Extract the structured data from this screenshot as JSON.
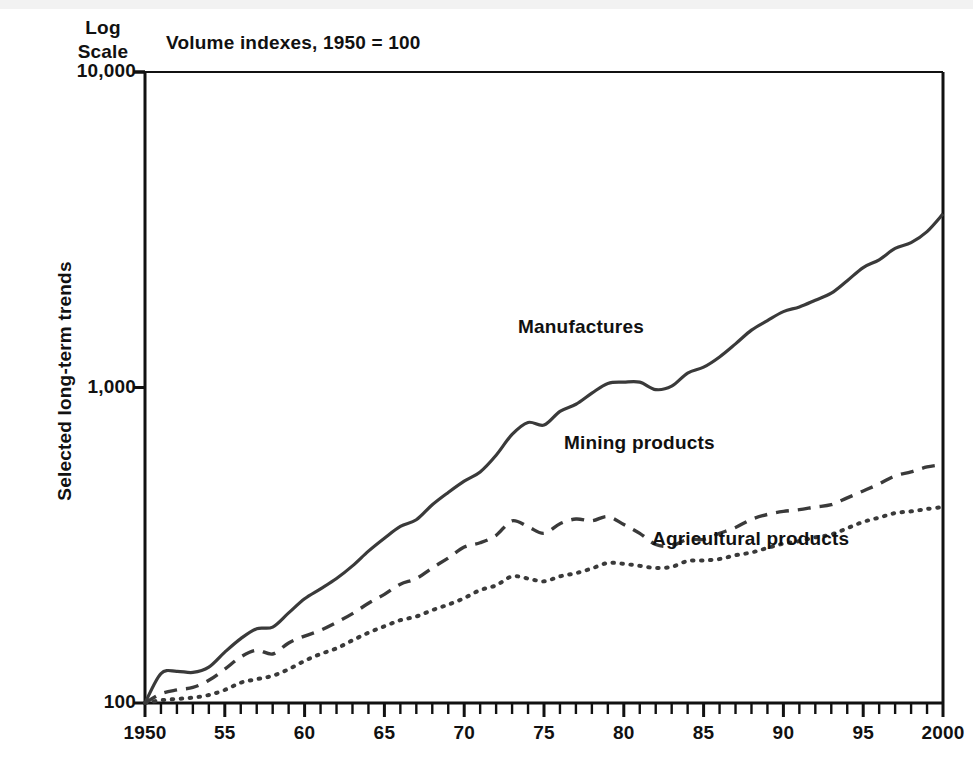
{
  "header": {
    "log_scale_line1": "Log",
    "log_scale_line2": "Scale",
    "title": "Volume indexes, 1950 = 100",
    "y_axis_title": "Selected long-term trends"
  },
  "labels": {
    "manufactures": "Manufactures",
    "mining": "Mining products",
    "agricultural": "Agricultural products"
  },
  "chart_data": {
    "type": "line",
    "title": "Volume indexes, 1950 = 100",
    "xlabel": "",
    "ylabel": "Selected long-term trends",
    "yscale": "log",
    "ylim": [
      100,
      10000
    ],
    "ytick_labels": [
      "100",
      "1,000",
      "10,000"
    ],
    "ytick_values": [
      100,
      1000,
      10000
    ],
    "xlim": [
      1950,
      2000
    ],
    "xtick_labels": [
      "1950",
      "55",
      "60",
      "65",
      "70",
      "75",
      "80",
      "85",
      "90",
      "95",
      "2000"
    ],
    "xtick_values": [
      1950,
      1955,
      1960,
      1965,
      1970,
      1975,
      1980,
      1985,
      1990,
      1995,
      2000
    ],
    "minor_xticks": "every year",
    "grid": false,
    "legend": "inline annotations",
    "line_color": "#3a3a3a",
    "x": [
      1950,
      1951,
      1952,
      1953,
      1954,
      1955,
      1956,
      1957,
      1958,
      1959,
      1960,
      1961,
      1962,
      1963,
      1964,
      1965,
      1966,
      1967,
      1968,
      1969,
      1970,
      1971,
      1972,
      1973,
      1974,
      1975,
      1976,
      1977,
      1978,
      1979,
      1980,
      1981,
      1982,
      1983,
      1984,
      1985,
      1986,
      1987,
      1988,
      1989,
      1990,
      1991,
      1992,
      1993,
      1994,
      1995,
      1996,
      1997,
      1998,
      1999,
      2000
    ],
    "series": [
      {
        "name": "Manufactures",
        "style": "solid",
        "values": [
          100,
          124,
          126,
          125,
          130,
          145,
          160,
          172,
          174,
          193,
          214,
          230,
          248,
          272,
          303,
          333,
          363,
          381,
          425,
          465,
          505,
          540,
          610,
          710,
          775,
          760,
          840,
          885,
          960,
          1030,
          1040,
          1040,
          985,
          1010,
          1110,
          1160,
          1250,
          1375,
          1520,
          1630,
          1740,
          1800,
          1890,
          1990,
          2180,
          2400,
          2540,
          2760,
          2880,
          3120,
          3550
        ]
      },
      {
        "name": "Mining products",
        "style": "dashed",
        "values": [
          100,
          107,
          110,
          112,
          118,
          128,
          140,
          147,
          143,
          155,
          163,
          170,
          180,
          192,
          207,
          221,
          238,
          248,
          268,
          288,
          312,
          322,
          340,
          378,
          362,
          345,
          370,
          383,
          378,
          390,
          368,
          345,
          318,
          315,
          330,
          330,
          345,
          360,
          382,
          396,
          405,
          410,
          418,
          425,
          447,
          470,
          495,
          525,
          540,
          560,
          570
        ]
      },
      {
        "name": "Agricultural products",
        "style": "dotted",
        "values": [
          100,
          102,
          103,
          104,
          106,
          110,
          116,
          119,
          122,
          128,
          136,
          143,
          149,
          158,
          167,
          175,
          183,
          188,
          197,
          205,
          215,
          228,
          236,
          252,
          248,
          243,
          252,
          258,
          267,
          278,
          276,
          272,
          268,
          270,
          282,
          283,
          286,
          294,
          300,
          310,
          320,
          326,
          335,
          342,
          358,
          375,
          387,
          400,
          405,
          412,
          418
        ]
      }
    ]
  }
}
